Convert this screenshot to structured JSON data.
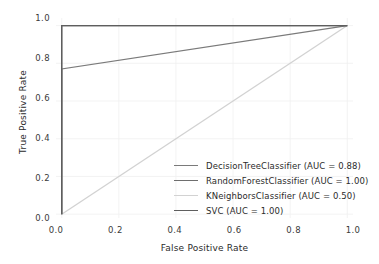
{
  "chart_data": {
    "type": "line",
    "title": "",
    "xlabel": "False Positive Rate",
    "ylabel": "True Positive Rate",
    "xlim": [
      -0.02,
      1.02
    ],
    "ylim": [
      -0.02,
      1.04
    ],
    "grid": true,
    "legend_position": "lower right",
    "xticks": [
      "0.0",
      "0.2",
      "0.4",
      "0.6",
      "0.8",
      "1.0"
    ],
    "xtick_values": [
      0.0,
      0.2,
      0.4,
      0.6,
      0.8,
      1.0
    ],
    "yticks": [
      "0.0",
      "0.2",
      "0.4",
      "0.6",
      "0.8",
      "1.0"
    ],
    "ytick_values": [
      0.0,
      0.2,
      0.4,
      0.6,
      0.8,
      1.0
    ],
    "series": [
      {
        "name": "DecisionTreeClassifier",
        "legend_label": "DecisionTreeClassifier (AUC = 0.88)",
        "auc": "0.88",
        "color": "#7a7a7a",
        "x": [
          0.0,
          0.0,
          1.0
        ],
        "y": [
          0.0,
          0.77,
          1.0
        ]
      },
      {
        "name": "RandomForestClassifier",
        "legend_label": "RandomForestClassifier (AUC = 1.00)",
        "auc": "1.00",
        "color": "#6e6e6e",
        "x": [
          0.0,
          0.0,
          1.0
        ],
        "y": [
          0.0,
          1.0,
          1.0
        ]
      },
      {
        "name": "KNeighborsClassifier",
        "legend_label": "KNeighborsClassifier (AUC = 0.50)",
        "auc": "0.50",
        "color": "#d2d2d2",
        "x": [
          0.0,
          1.0
        ],
        "y": [
          0.0,
          1.0
        ]
      },
      {
        "name": "SVC",
        "legend_label": "SVC (AUC = 1.00)",
        "auc": "1.00",
        "color": "#5e5e5e",
        "x": [
          0.0,
          0.0,
          1.0
        ],
        "y": [
          0.0,
          1.0,
          1.0
        ]
      }
    ]
  },
  "style": {
    "background": "#ffffff",
    "grid_color": "#f0f0f0",
    "tick_text_color": "#3a3a3a",
    "label_text_color": "#2b2b2b"
  }
}
